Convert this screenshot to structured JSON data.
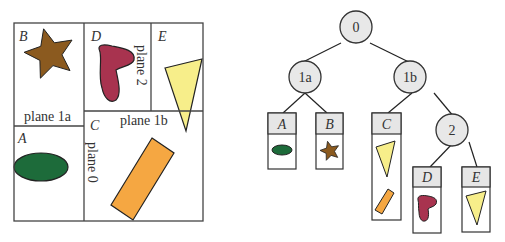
{
  "left_panel": {
    "regions": {
      "A": {
        "label": "A",
        "shape": "ellipse",
        "color": "#1d6b3a"
      },
      "B": {
        "label": "B",
        "shape": "star",
        "color": "#8b5a1f"
      },
      "C": {
        "label": "C",
        "shape": "rectangle",
        "color": "#f5a742"
      },
      "D": {
        "label": "D",
        "shape": "blob",
        "color": "#a8334f"
      },
      "E": {
        "label": "E",
        "shape": "triangle",
        "color": "#f7ee8a"
      }
    },
    "plane_labels": {
      "plane0": "plane 0",
      "plane1a": "plane 1a",
      "plane1b": "plane 1b",
      "plane2": "plane 2"
    }
  },
  "tree": {
    "nodes": [
      {
        "id": "0",
        "label": "0"
      },
      {
        "id": "1a",
        "label": "1a"
      },
      {
        "id": "1b",
        "label": "1b"
      },
      {
        "id": "2",
        "label": "2"
      }
    ],
    "leaves": [
      {
        "id": "A",
        "label": "A",
        "parent": "1a",
        "contents": [
          "ellipse"
        ]
      },
      {
        "id": "B",
        "label": "B",
        "parent": "1a",
        "contents": [
          "star"
        ]
      },
      {
        "id": "C",
        "label": "C",
        "parent": "1b",
        "contents": [
          "triangle",
          "rectangle"
        ]
      },
      {
        "id": "D",
        "label": "D",
        "parent": "2",
        "contents": [
          "blob"
        ]
      },
      {
        "id": "E",
        "label": "E",
        "parent": "2",
        "contents": [
          "triangle"
        ]
      }
    ],
    "edges": [
      [
        "0",
        "1a"
      ],
      [
        "0",
        "1b"
      ],
      [
        "1a",
        "A"
      ],
      [
        "1a",
        "B"
      ],
      [
        "1b",
        "C"
      ],
      [
        "1b",
        "2"
      ],
      [
        "2",
        "D"
      ],
      [
        "2",
        "E"
      ]
    ]
  },
  "colors": {
    "node_fill": "#e8e8e8",
    "line": "#222222",
    "leaf_header_fill": "#e6e6e6"
  }
}
